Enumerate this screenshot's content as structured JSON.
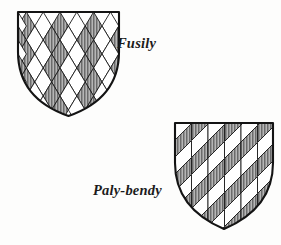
{
  "plate": {
    "background_color": "#fdfdfc",
    "ink_color": "#1b1b1b",
    "hatch_color": "#6f6f6f",
    "figures": [
      {
        "id": "fusily",
        "label": "Fusily",
        "description": "heraldic shield with a field of lozenges (fusils), alternately hatched and plain",
        "shield": {
          "left": 18,
          "right": 119,
          "top": 12,
          "point_y": 116,
          "center_x": 68.5
        },
        "pattern": {
          "type": "lozengy",
          "cell_width": 16.8,
          "cell_height": 28,
          "rows": 4,
          "columns": 6,
          "fill_alternating": true,
          "hatching": "vertical-lines"
        },
        "label_position": {
          "x": 117,
          "y": 35
        }
      },
      {
        "id": "paly-bendy",
        "label": "Paly-bendy",
        "description": "heraldic shield with vertical pales crossed by diagonal bends, alternately hatched and plain",
        "shield": {
          "left": 175,
          "right": 273,
          "top": 123,
          "point_y": 229,
          "center_x": 224
        },
        "pattern": {
          "type": "paly-bendy",
          "pale_width": 16.5,
          "bend_spacing": 17,
          "bend_angle_deg": -45,
          "fill_alternating": true,
          "hatching": "vertical-lines"
        },
        "label_position": {
          "x": 93,
          "y": 182
        }
      }
    ]
  }
}
